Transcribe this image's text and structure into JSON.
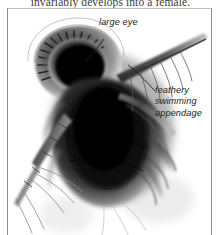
{
  "figure": {
    "body_text_above": "invariably develops into a female.",
    "media_type": "photomicrograph",
    "background_color": "#ffffff",
    "ink_color": "#1d1d1d",
    "rule_color": "#8e8e8e"
  },
  "annotations": {
    "eye": {
      "text": "large eye",
      "leader": "curved-line-to-eye"
    },
    "appendage": {
      "line1": "feathery",
      "line2": "swimming",
      "line3": "appendage",
      "leader": "line-to-appendage"
    }
  }
}
